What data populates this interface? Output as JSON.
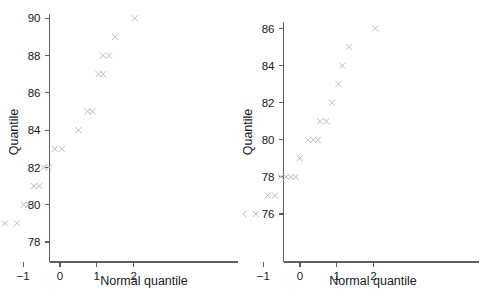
{
  "figure": {
    "background": "#ffffff",
    "marker_color": "#b9bdc1",
    "axis_color": "#5d6063",
    "text_color": "#16191c",
    "marker_glyph": "x-cross-marker",
    "panel_count": 2
  },
  "chart_data": [
    {
      "type": "scatter",
      "panel": "left",
      "title": "",
      "xlabel": "Normal quantile",
      "ylabel": "Quantile",
      "xlim": [
        -2.45,
        2.55
      ],
      "ylim": [
        77.1,
        90.55
      ],
      "xticks": [
        -2,
        -1,
        0,
        1,
        2
      ],
      "xticklabels": [
        "−2",
        "−1",
        "0",
        "1",
        "2"
      ],
      "yticks": [
        78,
        80,
        82,
        84,
        86,
        88,
        90
      ],
      "yticklabels": [
        "78",
        "80",
        "82",
        "84",
        "86",
        "88",
        "90"
      ],
      "grid": false,
      "legend": null,
      "marker": "x",
      "x": [
        -2.03,
        -1.5,
        -1.17,
        -0.99,
        -0.86,
        -0.71,
        -0.56,
        -0.44,
        -0.3,
        -0.14,
        0.05,
        0.5,
        0.75,
        0.88,
        1.05,
        1.17,
        1.17,
        1.33,
        1.5,
        2.03
      ],
      "y": [
        78,
        79,
        79,
        80,
        80,
        81,
        81,
        82,
        82,
        83,
        83,
        84,
        85,
        85,
        87,
        87,
        88,
        88,
        89,
        90
      ],
      "n_points": 20
    },
    {
      "type": "scatter",
      "panel": "right",
      "title": "",
      "xlabel": "Normal quantile",
      "ylabel": "Quantile",
      "xlim": [
        -2.45,
        2.55
      ],
      "ylim": [
        74.6,
        86.8
      ],
      "xticks": [
        -2,
        -1,
        0,
        1,
        2
      ],
      "xticklabels": [
        "−2",
        "−1",
        "0",
        "1",
        "2"
      ],
      "yticks": [
        76,
        78,
        80,
        82,
        84,
        86
      ],
      "yticklabels": [
        "76",
        "78",
        "80",
        "82",
        "84",
        "86"
      ],
      "grid": false,
      "legend": null,
      "marker": "x",
      "x": [
        -2.06,
        -1.55,
        -1.2,
        -0.88,
        -0.68,
        -0.52,
        -0.38,
        -0.25,
        -0.12,
        -0.01,
        0.22,
        0.36,
        0.49,
        0.55,
        0.72,
        0.87,
        1.05,
        1.15,
        1.33,
        2.05
      ],
      "y": [
        75,
        76,
        76,
        77,
        77,
        78,
        78,
        78,
        78,
        79,
        80,
        80,
        80,
        81,
        81,
        82,
        83,
        84,
        85,
        86
      ],
      "n_points": 20
    }
  ],
  "panels": [
    {
      "id": "left",
      "ylabel": "Quantile",
      "xlabel": "Normal quantile",
      "xticklabels": [
        "−2",
        "−1",
        "0",
        "1",
        "2"
      ],
      "yticklabels": [
        "78",
        "80",
        "82",
        "84",
        "86",
        "88",
        "90"
      ]
    },
    {
      "id": "right",
      "ylabel": "Quantile",
      "xlabel": "Normal quantile",
      "xticklabels": [
        "−2",
        "−1",
        "0",
        "1",
        "2"
      ],
      "yticklabels": [
        "76",
        "78",
        "80",
        "82",
        "84",
        "86"
      ]
    }
  ]
}
